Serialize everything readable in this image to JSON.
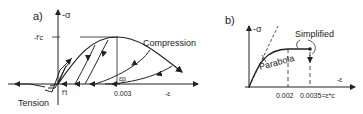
{
  "panel_a": {
    "tag": "a)",
    "y_axis_label": "-σ",
    "x_axis_label": "-ε",
    "peak_label": "-f'c",
    "tension_strength_label": "f't",
    "compression_label": "Compression",
    "tension_label": "Tension",
    "plastic_strain_label": "εp",
    "strain_tick": "0.003"
  },
  "panel_b": {
    "tag": "b)",
    "y_axis_label": "-σ",
    "x_axis_label": "-ε",
    "parabola_label": "Parabola",
    "simplified_label": "Simplified",
    "strain_tick_1": "0.002",
    "strain_tick_2": "0.0035=ε*c"
  },
  "colors": {
    "ink": "#222222",
    "background": "#ffffff"
  }
}
